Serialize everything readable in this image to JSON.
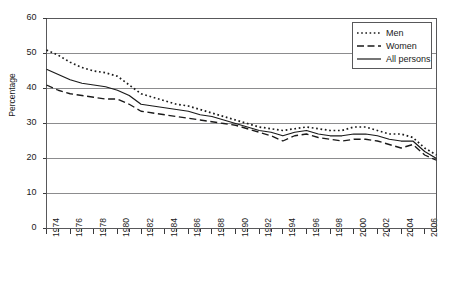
{
  "chart_data": {
    "type": "line",
    "title": "",
    "xlabel": "",
    "ylabel": "Percentage",
    "ylim": [
      0,
      60
    ],
    "ytick_step": 10,
    "yticks": [
      "0",
      "10",
      "20",
      "30",
      "40",
      "50",
      "60"
    ],
    "grid": true,
    "grid_axis": "y",
    "legend_position": "top-right",
    "xlim": [
      1974,
      2007
    ],
    "x": [
      1974,
      1975,
      1976,
      1977,
      1978,
      1979,
      1980,
      1981,
      1982,
      1983,
      1984,
      1985,
      1986,
      1987,
      1988,
      1989,
      1990,
      1991,
      1992,
      1993,
      1994,
      1995,
      1996,
      1997,
      1998,
      1999,
      2000,
      2001,
      2002,
      2003,
      2004,
      2005,
      2006,
      2007
    ],
    "xticks": [
      "1974",
      "1976",
      "1978",
      "1980",
      "1982",
      "1984",
      "1986",
      "1988",
      "1990",
      "1992",
      "1994",
      "1996",
      "1998",
      "2000",
      "2002",
      "2004",
      "2006"
    ],
    "xtick_values": [
      1974,
      1976,
      1978,
      1980,
      1982,
      1984,
      1986,
      1988,
      1990,
      1992,
      1994,
      1996,
      1998,
      2000,
      2002,
      2004,
      2006
    ],
    "series": [
      {
        "name": "Men",
        "style": "dotted",
        "color": "#1a1a1a",
        "values": [
          51.0,
          49.5,
          47.5,
          46.0,
          45.0,
          44.5,
          43.5,
          41.0,
          38.5,
          37.5,
          36.5,
          35.5,
          35.0,
          34.0,
          33.0,
          32.0,
          31.0,
          30.0,
          29.0,
          28.5,
          28.0,
          28.5,
          29.0,
          28.5,
          28.0,
          28.0,
          29.0,
          29.0,
          28.0,
          27.0,
          27.0,
          26.0,
          23.0,
          21.0
        ]
      },
      {
        "name": "Women",
        "style": "dashed",
        "color": "#1a1a1a",
        "values": [
          41.0,
          39.5,
          38.5,
          38.0,
          37.5,
          37.0,
          37.0,
          35.5,
          33.5,
          33.0,
          32.5,
          32.0,
          31.5,
          31.0,
          30.5,
          30.0,
          29.5,
          28.5,
          27.5,
          26.5,
          25.0,
          26.5,
          27.0,
          26.0,
          25.5,
          25.0,
          25.5,
          25.5,
          25.0,
          24.0,
          23.0,
          24.0,
          21.0,
          19.5
        ]
      },
      {
        "name": "All persons",
        "style": "solid",
        "color": "#1a1a1a",
        "values": [
          45.5,
          44.0,
          42.5,
          41.5,
          41.0,
          40.5,
          39.5,
          38.0,
          35.5,
          35.0,
          34.5,
          34.0,
          33.5,
          32.5,
          32.0,
          31.0,
          30.0,
          29.0,
          28.0,
          27.5,
          26.5,
          27.5,
          28.0,
          27.0,
          26.5,
          26.5,
          27.0,
          27.0,
          26.5,
          25.5,
          25.0,
          25.0,
          22.0,
          20.0
        ]
      }
    ]
  },
  "legend": {
    "items": [
      {
        "label": "Men"
      },
      {
        "label": "Women"
      },
      {
        "label": "All persons"
      }
    ]
  }
}
